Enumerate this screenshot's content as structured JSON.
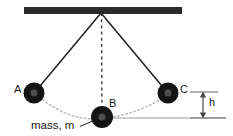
{
  "figure": {
    "type": "physics-diagram",
    "labels": {
      "bob_a": "A",
      "bob_b": "B",
      "bob_c": "C",
      "height": "h",
      "mass": "mass, m"
    },
    "colors": {
      "support_bar": "#2b2b2b",
      "string": "#1f1f1f",
      "bob_outer": "#141414",
      "bob_inner": "#4a4a4a",
      "arc_dotted": "#b9b9b9",
      "baseline": "#8f8f8f",
      "dimension": "#6e6e6e",
      "dashed_vertical": "#3a3a3a",
      "background": "#ffffff",
      "text": "#1a1a1a"
    },
    "geometry": {
      "support_bar": {
        "x1": 24,
        "x2": 182,
        "y": 10,
        "thickness": 7
      },
      "pivot": {
        "x": 101,
        "y": 13
      },
      "bob_radius": 10.5,
      "bob_inner_radius": 3.5,
      "bob_a": {
        "x": 34,
        "y": 93
      },
      "bob_b": {
        "x": 102,
        "y": 117
      },
      "bob_c": {
        "x": 168,
        "y": 93
      },
      "baseline": {
        "x1": 102,
        "x2": 226,
        "y": 118
      },
      "height_arrow": {
        "x": 203,
        "y_top": 92,
        "y_bottom": 118
      },
      "tick_top": {
        "x1": 190,
        "x2": 217,
        "y": 92
      },
      "tick_bottom": {
        "x1": 190,
        "x2": 226,
        "y": 118
      },
      "leader_line": {
        "x1": 80,
        "y1": 126,
        "x2": 98,
        "y2": 119
      }
    },
    "elements": [
      "horizontal support bar at top",
      "pivot point at bar center",
      "left string from pivot to bob A",
      "right string from pivot to bob C",
      "dashed vertical equilibrium line from pivot to bob B",
      "dotted swing arc through A, B, C",
      "horizontal reference baseline at B level",
      "double-headed vertical arrow labeled h"
    ]
  }
}
